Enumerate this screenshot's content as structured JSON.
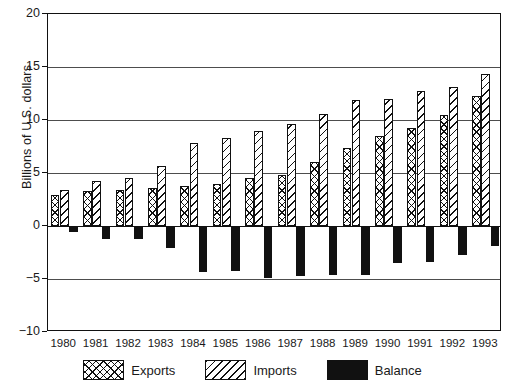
{
  "chart_data": {
    "type": "bar",
    "title": "",
    "xlabel": "",
    "ylabel": "Billions of U.S. dollars",
    "categories": [
      "1980",
      "1981",
      "1982",
      "1983",
      "1984",
      "1985",
      "1986",
      "1987",
      "1988",
      "1989",
      "1990",
      "1991",
      "1992",
      "1993"
    ],
    "series": [
      {
        "name": "Exports",
        "pattern": "cross-hatch",
        "values": [
          2.9,
          3.3,
          3.4,
          3.6,
          3.8,
          4.0,
          4.5,
          4.8,
          6.0,
          7.4,
          8.5,
          9.2,
          10.5,
          12.3
        ]
      },
      {
        "name": "Imports",
        "pattern": "diagonal-hatch",
        "values": [
          3.4,
          4.2,
          4.5,
          5.7,
          7.8,
          8.3,
          9.0,
          9.6,
          10.6,
          11.9,
          12.0,
          12.7,
          13.1,
          14.3
        ]
      },
      {
        "name": "Balance",
        "pattern": "solid-black",
        "values": [
          -0.6,
          -1.2,
          -1.2,
          -2.1,
          -4.3,
          -4.2,
          -4.9,
          -4.7,
          -4.6,
          -4.6,
          -3.5,
          -3.4,
          -2.7,
          -1.9
        ]
      }
    ],
    "ylim": [
      -10,
      20
    ],
    "yticks": [
      20,
      15,
      10,
      5,
      0,
      -5,
      -10
    ],
    "ytick_labels": [
      "20",
      "15",
      "10",
      "5",
      "0",
      "−5",
      "−10"
    ],
    "grid": "horizontal",
    "legend_position": "bottom",
    "colors": {
      "axis": "#111111",
      "gridline": "#4d4d4d",
      "balance_fill": "#111111",
      "background": "#ffffff"
    }
  },
  "legend": {
    "items": [
      {
        "label": "Exports",
        "swatch": "cross-hatch-swatch"
      },
      {
        "label": "Imports",
        "swatch": "diagonal-hatch-swatch"
      },
      {
        "label": "Balance",
        "swatch": "solid-black-swatch"
      }
    ]
  }
}
